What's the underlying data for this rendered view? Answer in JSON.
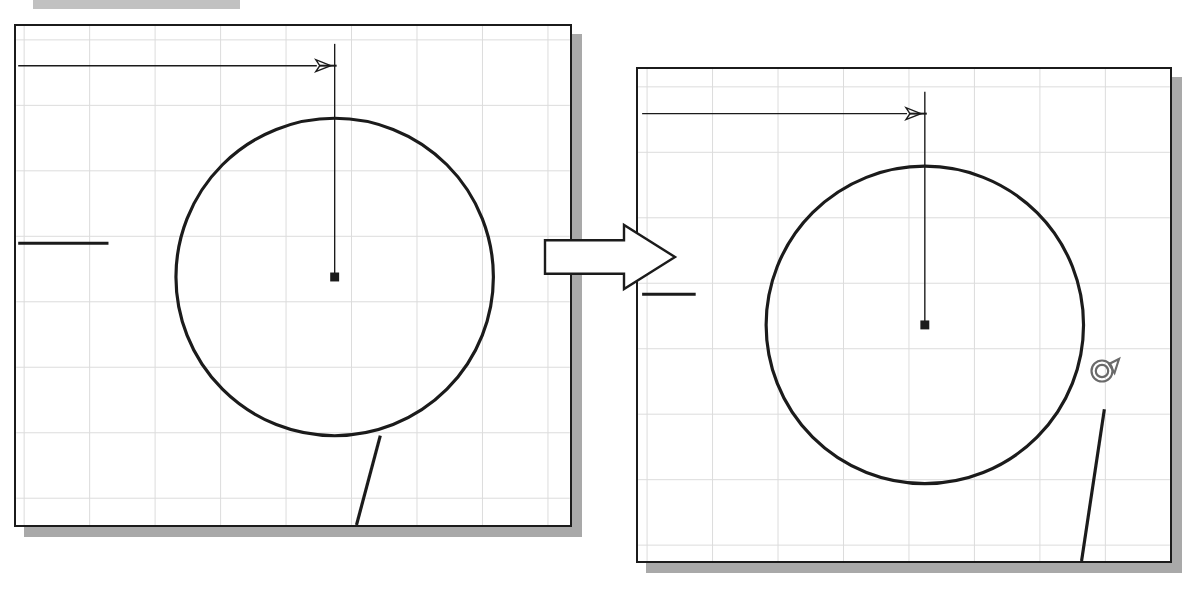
{
  "figure": {
    "type": "before-after-diagram",
    "background_color": "#ffffff",
    "line_color": "#1b1b1b",
    "grid_color": "#dcdcdc",
    "shadow_color": "#a9a9a9",
    "strip_color": "#b6b6b6"
  },
  "top_strip": {
    "name": "cropped-toolbar-strip",
    "x": 33,
    "y": 0,
    "width": 207,
    "height": 9
  },
  "panels": [
    {
      "id": "before",
      "label": "before-panel",
      "x": 14,
      "y": 24,
      "width": 558,
      "height": 503,
      "shadow_offset": 10,
      "grid": {
        "cell_width": 66,
        "cell_height": 66,
        "origin_x": 22,
        "origin_y": 38,
        "show": true
      },
      "dimension_line": {
        "name": "horizontal-dimension-line",
        "y": 64,
        "x_start": 16,
        "x_end": 317,
        "arrow_at": "end",
        "arrow_direction": "right"
      },
      "extension_line": {
        "name": "vertical-extension-line",
        "x": 335,
        "y_start": 42,
        "y_end": 277
      },
      "tick_mark": {
        "name": "left-edge-tick",
        "x_start": 16,
        "x_end": 107,
        "y": 243
      },
      "circle": {
        "name": "main-circle",
        "center_x": 335,
        "center_y": 277,
        "radius": 160
      },
      "center_marker": {
        "name": "circle-center-marker",
        "x": 335,
        "y": 277,
        "size": 9
      },
      "tangent_line": {
        "name": "tangent-leader-line",
        "x1": 357,
        "y1": 527,
        "x2": 381,
        "y2": 437
      }
    },
    {
      "id": "after",
      "label": "after-panel",
      "x": 636,
      "y": 67,
      "width": 536,
      "height": 496,
      "shadow_offset": 10,
      "grid": {
        "cell_width": 66,
        "cell_height": 66,
        "origin_x": 645,
        "origin_y": 85,
        "show": true
      },
      "dimension_line": {
        "name": "horizontal-dimension-line",
        "y": 112,
        "x_start": 640,
        "x_end": 907,
        "arrow_at": "end",
        "arrow_direction": "right"
      },
      "extension_line": {
        "name": "vertical-extension-line",
        "x": 925,
        "y_start": 90,
        "y_end": 325
      },
      "tick_mark": {
        "name": "left-edge-tick",
        "x_start": 640,
        "x_end": 694,
        "y": 294
      },
      "circle": {
        "name": "main-circle",
        "center_x": 925,
        "center_y": 325,
        "radius": 160
      },
      "center_marker": {
        "name": "circle-center-marker",
        "x": 925,
        "y": 325,
        "size": 9
      },
      "tangent_line": {
        "name": "tangent-leader-line",
        "x1": 1083,
        "y1": 563,
        "x2": 1106,
        "y2": 410
      }
    }
  ],
  "block_arrow": {
    "name": "transition-arrow",
    "direction": "right",
    "x": 543,
    "y": 222,
    "width": 135,
    "height": 70,
    "fill": "#ffffff",
    "stroke": "#1b1b1b"
  },
  "snap_cursor": {
    "name": "snap-cursor-icon",
    "glyph": "circle-with-tail",
    "x": 1085,
    "y": 347,
    "size": 42,
    "color": "#6a6a6a"
  }
}
